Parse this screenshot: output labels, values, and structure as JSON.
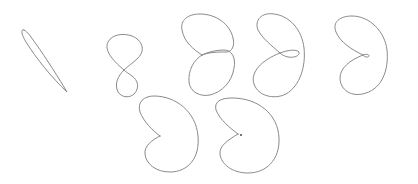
{
  "figure": {
    "stroke_color": "#8a8a8a",
    "background": "#ffffff",
    "rows": [
      {
        "curves": [
          {
            "id": 1,
            "shape": "thin-leaf"
          },
          {
            "id": 2,
            "shape": "figure-eight"
          },
          {
            "id": 3,
            "shape": "overlapping-lobes"
          },
          {
            "id": 4,
            "shape": "kidney-with-inner-loop"
          },
          {
            "id": 5,
            "shape": "kidney-with-tiny-loop"
          }
        ]
      },
      {
        "curves": [
          {
            "id": 6,
            "shape": "cardioid-cusp"
          },
          {
            "id": 7,
            "shape": "cardioid-cusp-with-dot"
          }
        ]
      }
    ]
  }
}
